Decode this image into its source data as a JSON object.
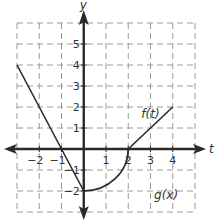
{
  "chart_data": {
    "type": "line",
    "title": "",
    "xlabel": "t",
    "ylabel": "y",
    "xlim": [
      -3,
      5
    ],
    "ylim": [
      -3,
      6
    ],
    "grid": true,
    "x_ticks": [
      -2,
      -1,
      1,
      2,
      3,
      4
    ],
    "y_ticks": [
      -2,
      -1,
      1,
      2,
      3,
      4,
      5
    ],
    "x_tick_labels": [
      "−2",
      "−1",
      "1",
      "2",
      "3",
      "4"
    ],
    "y_tick_labels": [
      "−2",
      "−1",
      "1",
      "2",
      "3",
      "4",
      "5"
    ],
    "series": [
      {
        "name": "g(x)",
        "kind": "linear",
        "points": [
          [
            -3,
            4
          ],
          [
            -1,
            0
          ],
          [
            0,
            -2
          ]
        ]
      },
      {
        "name": "f(t) arc",
        "kind": "quarter-circle",
        "center": [
          0,
          0
        ],
        "radius": 2,
        "from": [
          0,
          -2
        ],
        "to": [
          2,
          0
        ]
      },
      {
        "name": "f(t)",
        "kind": "linear",
        "points": [
          [
            2,
            0
          ],
          [
            4,
            2
          ]
        ]
      }
    ],
    "annotations": [
      {
        "text": "f(t)",
        "x": 3,
        "y": 1.5
      },
      {
        "text": "g(x)",
        "x": 3.7,
        "y": -2.4
      }
    ]
  }
}
